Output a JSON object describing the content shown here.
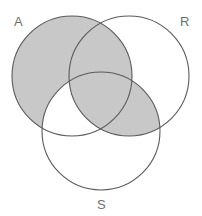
{
  "figure": {
    "type": "venn-diagram",
    "set_count": 3,
    "width": 202,
    "height": 216,
    "background_color": "#ffffff",
    "shade_color": "#c8c8c8",
    "outline_color": "#5a5a5a",
    "label_color": "#6e6e6e"
  },
  "sets": [
    {
      "id": "A",
      "label": "A",
      "label_x": 14,
      "label_y": 26,
      "center_x": 72,
      "center_y": 76,
      "radius": 60
    },
    {
      "id": "R",
      "label": "R",
      "label_x": 180,
      "label_y": 26,
      "center_x": 129,
      "center_y": 76,
      "radius": 60
    },
    {
      "id": "S",
      "label": "S",
      "label_x": 97,
      "label_y": 209,
      "center_x": 101,
      "center_y": 131,
      "radius": 59
    }
  ],
  "regions": [
    {
      "id": "A_only",
      "name": "A only",
      "shaded": true
    },
    {
      "id": "R_only",
      "name": "R only",
      "shaded": false
    },
    {
      "id": "S_only",
      "name": "S only",
      "shaded": false
    },
    {
      "id": "A_and_R",
      "name": "A intersect R only",
      "shaded": true
    },
    {
      "id": "A_and_S",
      "name": "A intersect S only",
      "shaded": false
    },
    {
      "id": "R_and_S",
      "name": "R intersect S only",
      "shaded": true
    },
    {
      "id": "A_R_S",
      "name": "A intersect R intersect S",
      "shaded": true
    }
  ],
  "shaded_expression": "A ∪ (R ∩ S)"
}
